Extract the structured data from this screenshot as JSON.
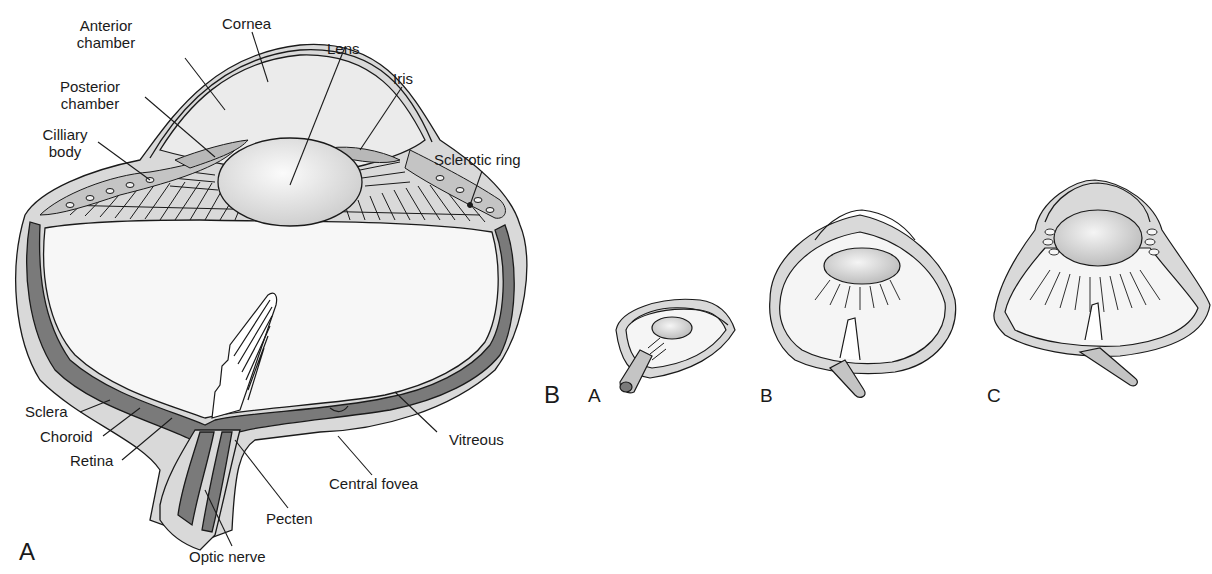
{
  "figure": {
    "panel_a": {
      "letter": "A",
      "labels": {
        "anterior_chamber_1": "Anterior",
        "anterior_chamber_2": "chamber",
        "cornea": "Cornea",
        "lens": "Lens",
        "posterior_chamber_1": "Posterior",
        "posterior_chamber_2": "chamber",
        "iris": "Iris",
        "ciliary_body_1": "Cilliary",
        "ciliary_body_2": "body",
        "sclerotic_ring": "Sclerotic ring",
        "sclera": "Sclera",
        "choroid": "Choroid",
        "retina": "Retina",
        "vitreous": "Vitreous",
        "central_fovea": "Central fovea",
        "pecten": "Pecten",
        "optic_nerve": "Optic nerve"
      }
    },
    "panel_b": {
      "letter": "B",
      "variants": [
        {
          "letter": "A"
        },
        {
          "letter": "B"
        },
        {
          "letter": "C"
        }
      ]
    },
    "colors": {
      "ink": "#1a1a1a",
      "tissue_light": "#d9d9d9",
      "tissue_mid": "#bdbdbd",
      "tissue_dark": "#7a7a7a",
      "vitreous": "#f7f7f7",
      "lens": "#e6e6e6"
    }
  }
}
